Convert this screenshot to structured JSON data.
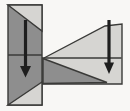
{
  "figure": {
    "canvas": {
      "width": 130,
      "height": 111,
      "background": "#f8f7f5"
    },
    "colors": {
      "dark_fill": "#8e8e8e",
      "light_fill": "#d6d5d2",
      "stroke": "#3a3a38",
      "arrow": "#1e1e1e"
    },
    "stroke_width": 1.4,
    "shapes": [
      {
        "name": "beam-body",
        "type": "polygon",
        "points": "44,58 105,26 122,24 122,84 42,84 42,58",
        "fill": "light_fill",
        "stroked": true
      },
      {
        "name": "beam-dark-stress-triangle",
        "type": "polygon",
        "points": "43,58.5 107,82.5 43,83.5",
        "fill": "dark_fill",
        "stroked": true
      },
      {
        "name": "beam-neutral-axis-line",
        "type": "line",
        "x1": 44,
        "y1": 58,
        "x2": 121.5,
        "y2": 58
      },
      {
        "name": "vertical-bar",
        "type": "polygon",
        "points": "8,5 42,5 42,105 8,105",
        "fill": "dark_fill",
        "stroked": true
      },
      {
        "name": "bar-top-light-triangle",
        "type": "polygon",
        "points": "8,5 42,5 42,31",
        "fill": "light_fill",
        "stroked": true
      },
      {
        "name": "bar-bottom-light-triangle",
        "type": "polygon",
        "points": "8,105 42,105 42,82",
        "fill": "light_fill",
        "stroked": true
      },
      {
        "name": "bar-neutral-axis-line",
        "type": "line",
        "x1": 8,
        "y1": 55,
        "x2": 42,
        "y2": 55
      }
    ],
    "arrows": [
      {
        "name": "left-force-arrow",
        "x": 25.5,
        "top": 20,
        "head_base": 66,
        "tip": 77.5,
        "half_width": 5.5,
        "shaft_width": 3.2
      },
      {
        "name": "right-force-arrow",
        "x": 109,
        "top": 20,
        "head_base": 62.5,
        "tip": 74,
        "half_width": 5,
        "shaft_width": 3.2
      }
    ]
  }
}
